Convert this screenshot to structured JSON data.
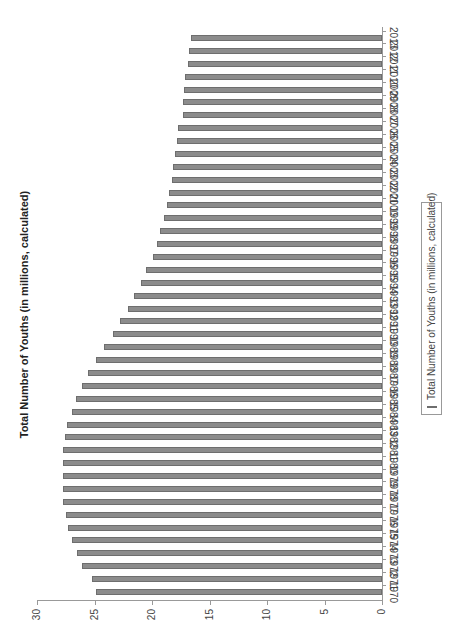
{
  "chart_data": {
    "type": "bar",
    "title": "Total Number of Youths (in millions, calculated)",
    "xlabel": "",
    "ylabel": "",
    "orientation": "rotated -90deg (years along right edge, values along bottom)",
    "ylim": [
      0,
      30
    ],
    "yticks": [
      0,
      5,
      10,
      15,
      20,
      25,
      30
    ],
    "grid": false,
    "legend_position": "right (bottom of unrotated chart)",
    "categories": [
      "1970",
      "1971",
      "1972",
      "1973",
      "1974",
      "1975",
      "1976",
      "1977",
      "1978",
      "1979",
      "1980",
      "1981",
      "1982",
      "1983",
      "1984",
      "1985",
      "1986",
      "1987",
      "1988",
      "1989",
      "1990",
      "1991",
      "1992",
      "1993",
      "1994",
      "1995",
      "1996",
      "1997",
      "1998",
      "1999",
      "2000",
      "2001",
      "2002",
      "2003",
      "2004",
      "2005",
      "2006",
      "2007",
      "2008",
      "2009",
      "2010",
      "2011",
      "2012",
      "2013"
    ],
    "series": [
      {
        "name": "Total Number of Youths (in millions, calculated)",
        "color": "#8c8c8c",
        "values": [
          24.9,
          25.2,
          26.1,
          26.5,
          27.0,
          27.3,
          27.5,
          27.7,
          27.7,
          27.7,
          27.7,
          27.7,
          27.6,
          27.4,
          27.0,
          26.6,
          26.1,
          25.6,
          24.9,
          24.2,
          23.4,
          22.8,
          22.1,
          21.6,
          21.0,
          20.5,
          19.9,
          19.6,
          19.3,
          19.0,
          18.7,
          18.5,
          18.3,
          18.2,
          18.0,
          17.8,
          17.7,
          17.3,
          17.3,
          17.2,
          17.1,
          16.9,
          16.8,
          16.6
        ]
      }
    ]
  },
  "legend": {
    "label": "Total Number of Youths (in millions, calculated)"
  }
}
